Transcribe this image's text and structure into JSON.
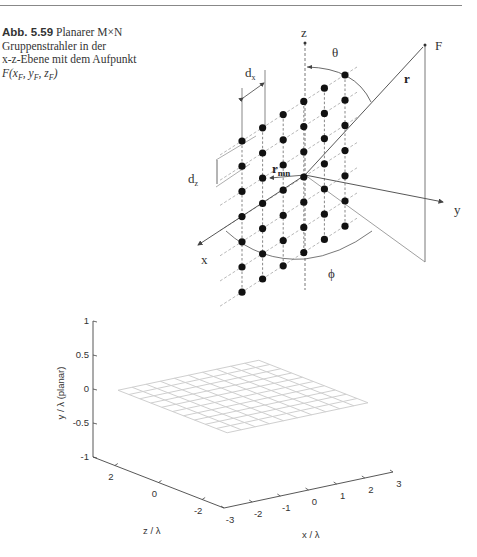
{
  "caption": {
    "figure_number": "Abb. 5.59",
    "line1": "Planarer M×N",
    "line2": "Gruppenstrahler in der",
    "line3": "x-z-Ebene mit dem Aufpunkt",
    "line4": "F(x_F, y_F, z_F)",
    "line4_display": "F(xF, yF, zF)"
  },
  "diagram": {
    "labels": {
      "z_axis": "z",
      "x_axis": "x",
      "y_axis": "y",
      "theta": "θ",
      "phi": "ϕ",
      "point_F": "F",
      "r_vector": "r",
      "r_mn": "r",
      "r_mn_sub": "mn",
      "dx": "d",
      "dx_sub": "x",
      "dz": "d",
      "dz_sub": "z"
    },
    "array": {
      "columns": 6,
      "rows": 7
    }
  },
  "chart_data": {
    "type": "surface3d",
    "title": "",
    "xlabel": "x / λ",
    "ylabel": "z / λ",
    "zlabel": "y / λ (planar)",
    "x_ticks": [
      "-3",
      "-2",
      "-1",
      "0",
      "1",
      "2",
      "3"
    ],
    "z_ticks": [
      "2",
      "0",
      "-2"
    ],
    "y_ticks": [
      "1",
      "0.5",
      "0",
      "-0.5",
      "-1"
    ],
    "xlim": [
      -3,
      3
    ],
    "zlim": [
      -3,
      3
    ],
    "ylim": [
      -1,
      1
    ],
    "surface": {
      "description": "flat planar mesh at y/λ = 0",
      "y_value": 0,
      "grid_lines": 11
    }
  }
}
